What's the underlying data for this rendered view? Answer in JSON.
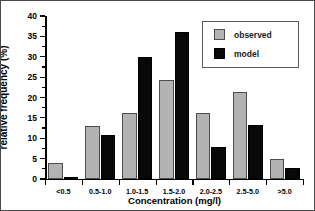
{
  "chart_data": {
    "type": "bar",
    "title": "",
    "xlabel": "Concentration (mg/l)",
    "ylabel": "relative frequency (%)",
    "categories": [
      "<0.5",
      "0.5-1.0",
      "1.0-1.5",
      "1.5-2.0",
      "2.0-2.5",
      "2.5-5.0",
      ">5.0"
    ],
    "series": [
      {
        "name": "observed",
        "color": "#b3b3b3",
        "values": [
          4.0,
          13.0,
          16.2,
          24.3,
          16.2,
          21.4,
          5.0
        ]
      },
      {
        "name": "model",
        "color": "#080808",
        "values": [
          0.4,
          10.8,
          30.0,
          36.1,
          7.8,
          13.2,
          2.7
        ]
      }
    ],
    "ylim": [
      0,
      40
    ],
    "ytick_labels": [
      "0",
      "5",
      "10",
      "15",
      "20",
      "25",
      "30",
      "35",
      "40"
    ],
    "ytick_values": [
      0,
      5,
      10,
      15,
      20,
      25,
      30,
      35,
      40
    ],
    "yminor_values": [
      2.5,
      7.5,
      12.5,
      17.5,
      22.5,
      27.5,
      32.5,
      37.5
    ],
    "grid": false,
    "legend_position": "top-right",
    "legend_entries": [
      "observed",
      "model"
    ]
  }
}
